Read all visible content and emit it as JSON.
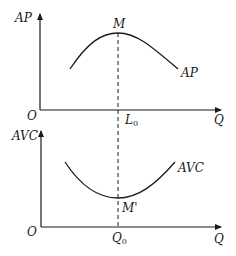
{
  "top_panel": {
    "y_axis_label": "AP",
    "x_axis_label": "Q",
    "origin_label": "O",
    "peak_label": "M",
    "curve_label": "AP",
    "marker_label_main": "L",
    "marker_label_sub": "0"
  },
  "bottom_panel": {
    "y_axis_label": "AVC",
    "x_axis_label": "Q",
    "origin_label": "O",
    "min_label": "M'",
    "curve_label": "AVC",
    "marker_label_main": "Q",
    "marker_label_sub": "0"
  },
  "colors": {
    "line": "#1a1a1a",
    "background": "#ffffff"
  }
}
